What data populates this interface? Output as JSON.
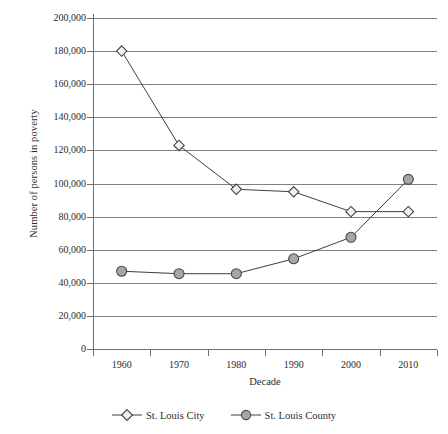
{
  "chart_data": {
    "type": "line",
    "title": "",
    "xlabel": "Decade",
    "ylabel": "Number of persons in poverty",
    "categories": [
      "1960",
      "1970",
      "1980",
      "1990",
      "2000",
      "2010"
    ],
    "ylim": [
      0,
      200000
    ],
    "ytick_labels": [
      "0",
      "20,000",
      "40,000",
      "60,000",
      "80,000",
      "100,000",
      "120,000",
      "140,000",
      "160,000",
      "180,000",
      "200,000"
    ],
    "ytick_values": [
      0,
      20000,
      40000,
      60000,
      80000,
      100000,
      120000,
      140000,
      160000,
      180000,
      200000
    ],
    "grid": true,
    "legend_position": "bottom",
    "series": [
      {
        "name": "St. Louis City",
        "marker": "diamond",
        "marker_fill": "#f2f2f2",
        "marker_stroke": "#404040",
        "line_color": "#3f3f3f",
        "values": [
          180000,
          123000,
          96500,
          95000,
          83000,
          83000
        ]
      },
      {
        "name": "St. Louis County",
        "marker": "circle",
        "marker_fill": "#a6a6a6",
        "marker_stroke": "#4a4a4a",
        "line_color": "#3f3f3f",
        "values": [
          47000,
          45500,
          45500,
          54500,
          67500,
          102500
        ]
      }
    ]
  },
  "colors": {
    "gridline": "#808080",
    "axis": "#6f6f6f",
    "text": "#2b2b2b",
    "background": "#ffffff"
  }
}
